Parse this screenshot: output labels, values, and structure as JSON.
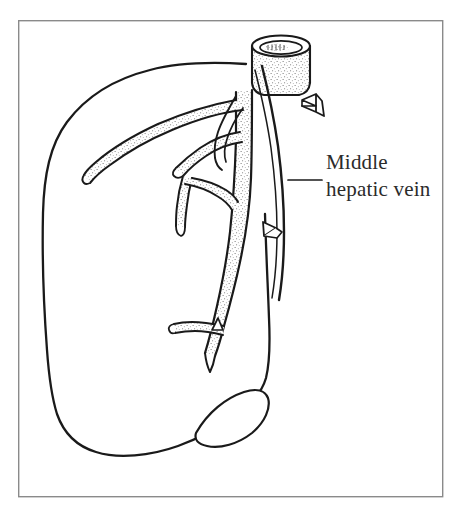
{
  "figure": {
    "kind": "line-drawing",
    "background_color": "#ffffff",
    "ink_color": "#1a1a1a",
    "stipple_color": "#555555",
    "border": {
      "name": "figure-border",
      "color": "#8a8a8a",
      "x": 18,
      "y": 20,
      "width": 425,
      "height": 477,
      "stroke_width": 1.4
    }
  },
  "annotations": {
    "leader_line": {
      "name": "leader-line",
      "color": "#1a1a1a",
      "x1": 288,
      "y1": 180,
      "x2": 322,
      "y2": 180
    },
    "label": {
      "name": "middle-hepatic-vein-label",
      "line_1": "Middle",
      "line_2": "hepatic vein",
      "x": 326,
      "y_line_1": 169,
      "y_line_2": 196,
      "font_size": 21,
      "color": "#2b2b2b"
    }
  },
  "structures": [
    {
      "name": "liver-outline",
      "label": "Liver parenchyma outline",
      "color": "#1a1a1a"
    },
    {
      "name": "inferior-vena-cava-stump",
      "label": "Cut inferior vena cava stump",
      "color": "#1a1a1a"
    },
    {
      "name": "middle-hepatic-vein",
      "label": "Middle hepatic vein trunk and tributaries",
      "color": "#1a1a1a"
    },
    {
      "name": "gallbladder",
      "label": "Gallbladder",
      "color": "#1a1a1a"
    },
    {
      "name": "surgical-clip-upper",
      "label": "Upper surgical clip",
      "color": "#1a1a1a"
    },
    {
      "name": "surgical-clip-lower",
      "label": "Lower surgical clip",
      "color": "#1a1a1a"
    }
  ]
}
